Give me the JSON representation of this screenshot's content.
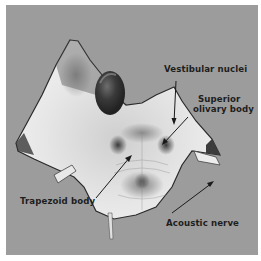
{
  "figure": {
    "labels": {
      "vestibular_nuclei": "Vestibular nuclei",
      "superior_olivary_line1": "Superior",
      "superior_olivary_line2": "olivary body",
      "trapezoid_body": "Trapezoid body",
      "acoustic_nerve": "Acoustic nerve"
    }
  }
}
